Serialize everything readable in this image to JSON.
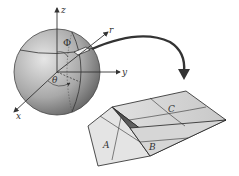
{
  "diagram": {
    "axes": {
      "z": "z",
      "y": "y",
      "x": "x",
      "r": "r"
    },
    "angles": {
      "polar": "Φ",
      "azimuthal": "θ"
    },
    "faces": {
      "a": "A",
      "b": "B",
      "c": "C"
    },
    "colors": {
      "sphere_light": "#d4d4d4",
      "sphere_dark": "#6a6a6a",
      "lines": "#333333",
      "face_light": "#e2e2e2",
      "face_dark": "#555555"
    }
  }
}
